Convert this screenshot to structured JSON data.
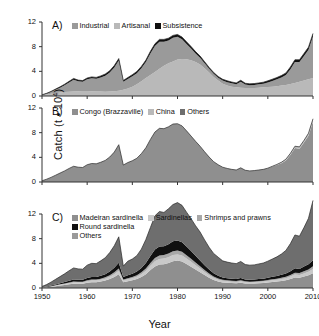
{
  "figure": {
    "ylabel": "Catch (t • 10",
    "ylabel_sup": "4",
    "ylabel_close": ")",
    "xlabel": "Year",
    "ytick_labels": [
      "0",
      "4",
      "8",
      "12"
    ],
    "yticks": [
      0,
      4,
      8,
      12
    ],
    "xtick_labels": [
      "1950",
      "1960",
      "1970",
      "1980",
      "1990",
      "2000",
      "2010"
    ],
    "xticks": [
      1950,
      1960,
      1970,
      1980,
      1990,
      2000,
      2010
    ]
  },
  "colors": {
    "dark_gray": "#6e6e6e",
    "mid_gray": "#9a9a9a",
    "light_gray": "#b9b9b9",
    "pale_gray": "#c9c9c9",
    "black": "#101010",
    "axis": "#333333",
    "background": "#ffffff"
  },
  "panels": [
    {
      "letter": "A)",
      "legend": [
        {
          "label": "Industrial",
          "color": "#9a9a9a"
        },
        {
          "label": "Artisanal",
          "color": "#b9b9b9"
        },
        {
          "label": "Subsistence",
          "color": "#101010"
        }
      ]
    },
    {
      "letter": "B)",
      "legend": [
        {
          "label": "Congo (Brazzaville)",
          "color": "#8f8f8f"
        },
        {
          "label": "China",
          "color": "#b9b9b9"
        },
        {
          "label": "Others",
          "color": "#6e6e6e"
        }
      ]
    },
    {
      "letter": "C)",
      "legend": [
        {
          "label": "Madeiran sardinella",
          "color": "#8f8f8f"
        },
        {
          "label": "Sardinellas",
          "color": "#c9c9c9"
        },
        {
          "label": "Shrimps and prawns",
          "color": "#a8a8a8"
        },
        {
          "label": "Round sardinella",
          "color": "#101010"
        },
        {
          "label": "Others",
          "color": "#9a9a9a"
        }
      ]
    }
  ],
  "chart_data": [
    {
      "type": "area",
      "panel": "A",
      "title": "A)",
      "stacked": true,
      "xlabel": "Year",
      "ylabel": "Catch (t • 10^4)",
      "xlim": [
        1950,
        2010
      ],
      "ylim": [
        0,
        12
      ],
      "grid": false,
      "legend_position": "top",
      "x": [
        1950,
        1951,
        1952,
        1953,
        1954,
        1955,
        1956,
        1957,
        1958,
        1959,
        1960,
        1961,
        1962,
        1963,
        1964,
        1965,
        1966,
        1967,
        1968,
        1969,
        1970,
        1971,
        1972,
        1973,
        1974,
        1975,
        1976,
        1977,
        1978,
        1979,
        1980,
        1981,
        1982,
        1983,
        1984,
        1985,
        1986,
        1987,
        1988,
        1989,
        1990,
        1991,
        1992,
        1993,
        1994,
        1995,
        1996,
        1997,
        1998,
        1999,
        2000,
        2001,
        2002,
        2003,
        2004,
        2005,
        2006,
        2007,
        2008,
        2009,
        2010
      ],
      "series": [
        {
          "name": "Artisanal",
          "color": "#b9b9b9",
          "values": [
            0.15,
            0.25,
            0.35,
            0.45,
            0.55,
            0.65,
            0.7,
            0.75,
            0.78,
            0.8,
            0.8,
            0.78,
            0.75,
            0.72,
            0.7,
            0.72,
            0.78,
            0.85,
            1.0,
            1.2,
            1.5,
            1.9,
            2.4,
            2.9,
            3.4,
            3.9,
            4.4,
            4.9,
            5.3,
            5.6,
            5.9,
            6.0,
            5.95,
            5.8,
            5.5,
            5.1,
            4.5,
            3.8,
            3.1,
            2.5,
            2.0,
            1.7,
            1.5,
            1.4,
            1.35,
            1.3,
            1.3,
            1.3,
            1.35,
            1.4,
            1.45,
            1.5,
            1.6,
            1.7,
            1.8,
            1.95,
            2.1,
            2.3,
            2.5,
            2.7,
            2.9
          ]
        },
        {
          "name": "Industrial",
          "color": "#9a9a9a",
          "values": [
            0.0,
            0.1,
            0.3,
            0.55,
            0.8,
            1.1,
            1.5,
            1.9,
            1.6,
            1.5,
            1.9,
            2.1,
            2.05,
            2.3,
            2.6,
            3.1,
            3.85,
            4.9,
            1.3,
            1.55,
            1.7,
            1.8,
            2.1,
            2.6,
            3.5,
            4.2,
            4.4,
            3.9,
            3.7,
            3.85,
            3.7,
            3.2,
            2.5,
            1.9,
            1.4,
            1.1,
            0.8,
            0.6,
            0.5,
            0.45,
            0.5,
            0.55,
            0.55,
            0.5,
            0.95,
            0.55,
            0.45,
            0.5,
            0.55,
            0.6,
            0.75,
            0.95,
            1.1,
            1.3,
            1.6,
            2.4,
            3.4,
            3.2,
            4.0,
            4.8,
            6.8
          ]
        },
        {
          "name": "Subsistence",
          "color": "#101010",
          "values": [
            0.05,
            0.08,
            0.1,
            0.12,
            0.14,
            0.16,
            0.18,
            0.2,
            0.2,
            0.2,
            0.22,
            0.22,
            0.22,
            0.24,
            0.26,
            0.28,
            0.3,
            0.32,
            0.22,
            0.24,
            0.26,
            0.28,
            0.3,
            0.32,
            0.34,
            0.36,
            0.38,
            0.38,
            0.38,
            0.38,
            0.38,
            0.36,
            0.34,
            0.32,
            0.3,
            0.28,
            0.26,
            0.24,
            0.22,
            0.22,
            0.22,
            0.22,
            0.22,
            0.22,
            0.25,
            0.22,
            0.22,
            0.22,
            0.22,
            0.24,
            0.26,
            0.28,
            0.3,
            0.32,
            0.34,
            0.36,
            0.38,
            0.38,
            0.4,
            0.42,
            0.44
          ]
        }
      ]
    },
    {
      "type": "area",
      "panel": "B",
      "title": "B)",
      "stacked": true,
      "xlabel": "Year",
      "ylabel": "Catch (t • 10^4)",
      "xlim": [
        1950,
        2010
      ],
      "ylim": [
        0,
        12
      ],
      "grid": false,
      "legend_position": "top",
      "x": [
        1950,
        1951,
        1952,
        1953,
        1954,
        1955,
        1956,
        1957,
        1958,
        1959,
        1960,
        1961,
        1962,
        1963,
        1964,
        1965,
        1966,
        1967,
        1968,
        1969,
        1970,
        1971,
        1972,
        1973,
        1974,
        1975,
        1976,
        1977,
        1978,
        1979,
        1980,
        1981,
        1982,
        1983,
        1984,
        1985,
        1986,
        1987,
        1988,
        1989,
        1990,
        1991,
        1992,
        1993,
        1994,
        1995,
        1996,
        1997,
        1998,
        1999,
        2000,
        2001,
        2002,
        2003,
        2004,
        2005,
        2006,
        2007,
        2008,
        2009,
        2010
      ],
      "series": [
        {
          "name": "Congo (Brazzaville)",
          "color": "#8f8f8f",
          "values": [
            0.2,
            0.45,
            0.75,
            1.1,
            1.45,
            1.8,
            2.2,
            2.55,
            2.4,
            2.35,
            2.8,
            3.0,
            2.95,
            3.2,
            3.5,
            4.05,
            4.85,
            6.05,
            2.75,
            3.15,
            3.45,
            3.85,
            4.6,
            5.55,
            6.9,
            8.1,
            8.7,
            8.65,
            8.95,
            9.4,
            9.45,
            9.1,
            8.3,
            7.45,
            6.6,
            5.8,
            4.9,
            4.05,
            3.3,
            2.8,
            2.4,
            2.2,
            2.05,
            1.95,
            2.3,
            1.9,
            1.8,
            1.85,
            1.95,
            2.05,
            2.25,
            2.5,
            2.75,
            3.05,
            3.5,
            4.4,
            5.5,
            5.4,
            6.4,
            7.5,
            9.8
          ]
        },
        {
          "name": "China",
          "color": "#b9b9b9",
          "values": [
            0,
            0,
            0,
            0,
            0,
            0,
            0,
            0,
            0,
            0,
            0,
            0,
            0,
            0,
            0,
            0,
            0,
            0,
            0,
            0,
            0,
            0,
            0,
            0,
            0,
            0,
            0,
            0,
            0,
            0,
            0,
            0,
            0,
            0,
            0,
            0,
            0,
            0,
            0,
            0,
            0,
            0,
            0,
            0,
            0,
            0,
            0,
            0,
            0,
            0,
            0,
            0.05,
            0.1,
            0.15,
            0.2,
            0.25,
            0.3,
            0.3,
            0.35,
            0.4,
            0.45
          ]
        },
        {
          "name": "Others",
          "color": "#6e6e6e",
          "values": [
            0,
            0,
            0,
            0,
            0,
            0,
            0,
            0,
            0,
            0,
            0,
            0,
            0,
            0,
            0,
            0,
            0,
            0,
            0,
            0,
            0,
            0,
            0,
            0,
            0,
            0,
            0,
            0,
            0,
            0,
            0,
            0,
            0,
            0,
            0,
            0,
            0,
            0,
            0,
            0,
            0,
            0,
            0,
            0,
            0,
            0,
            0,
            0,
            0,
            0,
            0,
            0,
            0,
            0,
            0,
            0,
            0,
            0,
            0,
            0,
            0
          ]
        }
      ]
    },
    {
      "type": "area",
      "panel": "C",
      "title": "C)",
      "stacked": true,
      "xlabel": "Year",
      "ylabel": "Catch (t • 10^4)",
      "xlim": [
        1950,
        2010
      ],
      "ylim": [
        0,
        12
      ],
      "grid": false,
      "legend_position": "top",
      "x": [
        1950,
        1951,
        1952,
        1953,
        1954,
        1955,
        1956,
        1957,
        1958,
        1959,
        1960,
        1961,
        1962,
        1963,
        1964,
        1965,
        1966,
        1967,
        1968,
        1969,
        1970,
        1971,
        1972,
        1973,
        1974,
        1975,
        1976,
        1977,
        1978,
        1979,
        1980,
        1981,
        1982,
        1983,
        1984,
        1985,
        1986,
        1987,
        1988,
        1989,
        1990,
        1991,
        1992,
        1993,
        1994,
        1995,
        1996,
        1997,
        1998,
        1999,
        2000,
        2001,
        2002,
        2003,
        2004,
        2005,
        2006,
        2007,
        2008,
        2009,
        2010
      ],
      "series": [
        {
          "name": "Madeiran sardinella",
          "color": "#8f8f8f",
          "values": [
            0.05,
            0.12,
            0.2,
            0.3,
            0.4,
            0.5,
            0.6,
            0.7,
            0.7,
            0.7,
            0.85,
            0.95,
            0.95,
            1.05,
            1.2,
            1.45,
            1.8,
            2.25,
            0.95,
            1.1,
            1.25,
            1.45,
            1.8,
            2.25,
            2.9,
            3.5,
            3.8,
            3.85,
            4.05,
            4.35,
            4.45,
            4.3,
            3.9,
            3.45,
            3.0,
            2.55,
            2.1,
            1.65,
            1.3,
            1.05,
            0.9,
            0.85,
            0.8,
            0.78,
            0.85,
            0.75,
            0.72,
            0.74,
            0.78,
            0.82,
            0.9,
            0.98,
            1.05,
            1.15,
            1.25,
            1.45,
            1.7,
            1.65,
            1.85,
            2.05,
            2.4
          ]
        },
        {
          "name": "Sardinellas",
          "color": "#c9c9c9",
          "values": [
            0.02,
            0.04,
            0.06,
            0.09,
            0.12,
            0.15,
            0.18,
            0.21,
            0.2,
            0.2,
            0.24,
            0.26,
            0.26,
            0.28,
            0.32,
            0.38,
            0.45,
            0.55,
            0.25,
            0.3,
            0.33,
            0.38,
            0.45,
            0.55,
            0.7,
            0.85,
            0.92,
            0.92,
            0.95,
            1.0,
            1.0,
            0.96,
            0.88,
            0.8,
            0.7,
            0.6,
            0.5,
            0.42,
            0.35,
            0.3,
            0.26,
            0.24,
            0.22,
            0.21,
            0.24,
            0.2,
            0.19,
            0.2,
            0.21,
            0.22,
            0.24,
            0.26,
            0.28,
            0.3,
            0.34,
            0.4,
            0.47,
            0.46,
            0.52,
            0.58,
            0.68
          ]
        },
        {
          "name": "Shrimps and prawns",
          "color": "#a8a8a8",
          "values": [
            0.01,
            0.02,
            0.04,
            0.06,
            0.08,
            0.1,
            0.12,
            0.14,
            0.13,
            0.13,
            0.16,
            0.17,
            0.17,
            0.19,
            0.21,
            0.25,
            0.3,
            0.36,
            0.17,
            0.19,
            0.21,
            0.24,
            0.29,
            0.35,
            0.44,
            0.53,
            0.57,
            0.57,
            0.59,
            0.62,
            0.63,
            0.6,
            0.55,
            0.5,
            0.44,
            0.38,
            0.32,
            0.27,
            0.22,
            0.19,
            0.17,
            0.15,
            0.14,
            0.14,
            0.16,
            0.13,
            0.12,
            0.13,
            0.14,
            0.14,
            0.16,
            0.17,
            0.19,
            0.2,
            0.23,
            0.27,
            0.32,
            0.31,
            0.35,
            0.39,
            0.45
          ]
        },
        {
          "name": "Round sardinella",
          "color": "#101010",
          "values": [
            0.02,
            0.05,
            0.09,
            0.13,
            0.17,
            0.22,
            0.27,
            0.32,
            0.3,
            0.3,
            0.36,
            0.4,
            0.4,
            0.45,
            0.5,
            0.6,
            0.75,
            0.95,
            0.4,
            0.46,
            0.52,
            0.6,
            0.72,
            0.9,
            1.15,
            1.35,
            1.45,
            1.45,
            1.5,
            1.6,
            1.62,
            1.55,
            1.42,
            1.26,
            1.1,
            0.94,
            0.78,
            0.64,
            0.52,
            0.44,
            0.38,
            0.35,
            0.33,
            0.32,
            0.38,
            0.31,
            0.3,
            0.31,
            0.32,
            0.34,
            0.37,
            0.4,
            0.44,
            0.48,
            0.52,
            0.6,
            0.7,
            0.68,
            0.76,
            0.85,
            0.95
          ]
        },
        {
          "name": "Others",
          "color": "#6e6e6e",
          "values": [
            0.15,
            0.32,
            0.56,
            0.82,
            1.08,
            1.33,
            1.63,
            1.88,
            1.77,
            1.72,
            2.09,
            2.22,
            2.17,
            2.43,
            2.67,
            3.07,
            3.55,
            4.19,
            1.78,
            2.3,
            2.39,
            2.58,
            3.04,
            3.82,
            4.61,
            5.47,
            5.66,
            5.46,
            5.76,
            5.96,
            6.15,
            5.99,
            5.55,
            5.24,
            4.86,
            4.61,
            4.1,
            3.62,
            3.21,
            3.02,
            2.69,
            2.61,
            2.56,
            2.5,
            2.67,
            2.41,
            2.37,
            2.37,
            2.45,
            2.53,
            2.68,
            2.89,
            3.09,
            3.37,
            3.76,
            4.48,
            5.41,
            5.3,
            6.32,
            7.43,
            9.72
          ]
        }
      ]
    }
  ]
}
